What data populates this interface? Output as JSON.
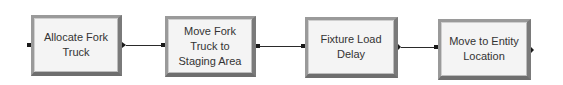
{
  "diagram": {
    "type": "process-flow",
    "blocks": [
      {
        "id": "b1",
        "label": "Allocate Fork Truck"
      },
      {
        "id": "b2",
        "label": "Move Fork Truck to Staging Area"
      },
      {
        "id": "b3",
        "label": "Fixture Load Delay"
      },
      {
        "id": "b4",
        "label": "Move to Entity Location"
      }
    ],
    "connections": [
      {
        "from": "b1",
        "to": "b2"
      },
      {
        "from": "b2",
        "to": "b3"
      },
      {
        "from": "b3",
        "to": "b4"
      }
    ],
    "colors": {
      "block_fill": "#f4f4f4",
      "block_border": "#8a8a8a",
      "wire": "#2a2a2a",
      "text": "#333333"
    }
  }
}
